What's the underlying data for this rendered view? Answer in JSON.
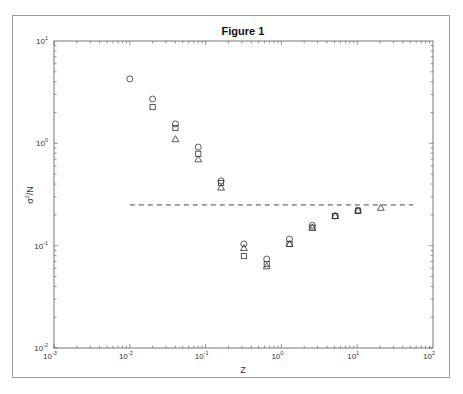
{
  "figure": {
    "title": "Figure 1",
    "xlabel": "Z",
    "ylabel_base": "σ",
    "ylabel_sup": "2",
    "ylabel_rest": "/N",
    "x_ticks": [
      {
        "base": "10",
        "exp": "-3"
      },
      {
        "base": "10",
        "exp": "-2"
      },
      {
        "base": "10",
        "exp": "-1"
      },
      {
        "base": "10",
        "exp": "0"
      },
      {
        "base": "10",
        "exp": "1"
      },
      {
        "base": "10",
        "exp": "2"
      }
    ],
    "y_ticks": [
      {
        "base": "10",
        "exp": "1"
      },
      {
        "base": "10",
        "exp": "0"
      },
      {
        "base": "10",
        "exp": "-1"
      },
      {
        "base": "10",
        "exp": "-2"
      }
    ]
  },
  "chart_data": {
    "type": "scatter",
    "title": "Figure 1",
    "xlabel": "Z",
    "ylabel": "σ²/N",
    "xscale": "log",
    "yscale": "log",
    "xlim": [
      0.001,
      100
    ],
    "ylim": [
      0.01,
      10
    ],
    "grid": false,
    "legend": null,
    "series": [
      {
        "name": "circles",
        "marker": "circle",
        "x": [
          0.01,
          0.02,
          0.04,
          0.08,
          0.16,
          0.32,
          0.64,
          1.28,
          2.56,
          5.12,
          10.24
        ],
        "y": [
          4.26,
          2.71,
          1.55,
          0.92,
          0.43,
          0.104,
          0.074,
          0.116,
          0.158,
          0.195,
          0.22
        ]
      },
      {
        "name": "squares",
        "marker": "square",
        "x": [
          0.02,
          0.04,
          0.08,
          0.16,
          0.32,
          0.64,
          1.28,
          2.56,
          5.12,
          10.24
        ],
        "y": [
          2.26,
          1.41,
          0.79,
          0.41,
          0.079,
          0.066,
          0.104,
          0.15,
          0.195,
          0.22
        ]
      },
      {
        "name": "triangles",
        "marker": "triangle",
        "x": [
          0.04,
          0.08,
          0.16,
          0.32,
          0.64,
          1.28,
          2.56,
          5.12,
          10.24,
          20.48
        ],
        "y": [
          1.1,
          0.7,
          0.37,
          0.095,
          0.063,
          0.104,
          0.15,
          0.195,
          0.22,
          0.235
        ]
      }
    ],
    "reference_line": {
      "style": "dashed",
      "y": 0.25,
      "x_range": [
        0.01,
        55
      ]
    }
  }
}
